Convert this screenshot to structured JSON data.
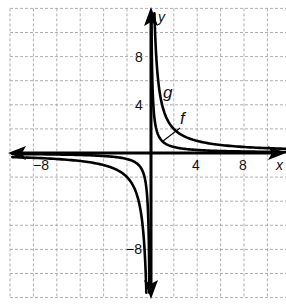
{
  "chart_data": {
    "type": "line",
    "title": "",
    "xlabel": "x",
    "ylabel": "y",
    "xlim": [
      -12,
      12
    ],
    "ylim": [
      -12,
      12
    ],
    "grid": true,
    "grid_step": 2,
    "x_tick_labels": [
      {
        "value": -8,
        "label": "−8"
      },
      {
        "value": 4,
        "label": "4"
      },
      {
        "value": 8,
        "label": "8"
      }
    ],
    "y_tick_labels": [
      {
        "value": 8,
        "label": "8"
      },
      {
        "value": 4,
        "label": "4"
      },
      {
        "value": -8,
        "label": "−8"
      }
    ],
    "series": [
      {
        "name": "f",
        "equation": "f(x) = 1/x",
        "k": 1,
        "points": [
          [
            0.1,
            10
          ],
          [
            0.5,
            2
          ],
          [
            1,
            1
          ],
          [
            2,
            0.5
          ],
          [
            4,
            0.25
          ],
          [
            8,
            0.125
          ],
          [
            12,
            0.083
          ],
          [
            -0.1,
            -10
          ],
          [
            -0.5,
            -2
          ],
          [
            -1,
            -1
          ],
          [
            -2,
            -0.5
          ],
          [
            -4,
            -0.25
          ],
          [
            -8,
            -0.125
          ],
          [
            -12,
            -0.083
          ]
        ]
      },
      {
        "name": "g",
        "equation": "g(x) = 4/x",
        "k": 4,
        "points": [
          [
            0.35,
            11.4
          ],
          [
            0.5,
            8
          ],
          [
            1,
            4
          ],
          [
            2,
            2
          ],
          [
            4,
            1
          ],
          [
            8,
            0.5
          ],
          [
            12,
            0.333
          ],
          [
            -0.35,
            -11.4
          ],
          [
            -0.5,
            -8
          ],
          [
            -1,
            -4
          ],
          [
            -2,
            -2
          ],
          [
            -4,
            -1
          ],
          [
            -8,
            -0.5
          ],
          [
            -12,
            -0.333
          ]
        ]
      }
    ],
    "annotations": [
      {
        "text": "g",
        "near_series": "g"
      },
      {
        "text": "f",
        "near_series": "f",
        "leader_line": true
      }
    ],
    "legend": "none"
  },
  "labels": {
    "x_axis": "x",
    "y_axis": "y",
    "f": "f",
    "g": "g",
    "x_neg8": "−8",
    "x_4": "4",
    "x_8": "8",
    "y_8": "8",
    "y_4": "4",
    "y_neg8": "−8"
  }
}
